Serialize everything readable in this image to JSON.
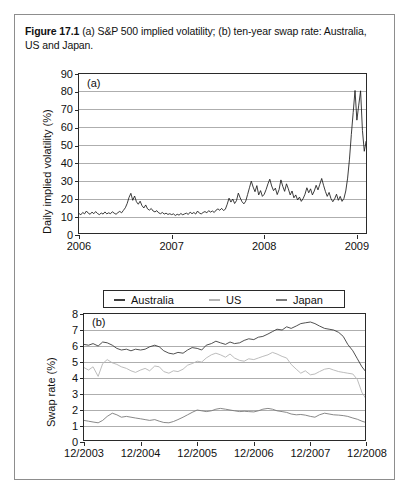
{
  "figure": {
    "caption_label": "Figure 17.1",
    "caption_text": "(a) S&P 500 implied volatility; (b) ten-year swap rate: Australia, US and Japan.",
    "border_color": "#8d8d8d"
  },
  "legend": {
    "items": [
      {
        "label": "Australia",
        "color": "#3d3d3d"
      },
      {
        "label": "US",
        "color": "#b4b4b4"
      },
      {
        "label": "Japan",
        "color": "#7a7a7a"
      }
    ]
  },
  "chart_data": [
    {
      "id": "panel-a",
      "type": "line",
      "panel_tag": "(a)",
      "title": "S&P 500 implied volatility",
      "xlabel": "",
      "ylabel": "Daily implied volatility (%)",
      "ylim": [
        0,
        90
      ],
      "yticks": [
        0,
        10,
        20,
        30,
        40,
        50,
        60,
        70,
        80,
        90
      ],
      "xlim": [
        2006.0,
        2009.12
      ],
      "xticks": [
        2006,
        2007,
        2008,
        2009
      ],
      "xticklabels": [
        "2006",
        "2007",
        "2008",
        "2009"
      ],
      "grid": true,
      "legend_position": "none",
      "line_color": "#1a1a1a",
      "series": [
        {
          "name": "S&P 500 implied volatility",
          "x": [
            2006.0,
            2006.02,
            2006.04,
            2006.06,
            2006.08,
            2006.1,
            2006.12,
            2006.14,
            2006.16,
            2006.18,
            2006.2,
            2006.22,
            2006.24,
            2006.26,
            2006.28,
            2006.3,
            2006.32,
            2006.34,
            2006.36,
            2006.38,
            2006.4,
            2006.42,
            2006.44,
            2006.46,
            2006.48,
            2006.5,
            2006.52,
            2006.54,
            2006.56,
            2006.58,
            2006.6,
            2006.62,
            2006.64,
            2006.66,
            2006.68,
            2006.7,
            2006.72,
            2006.74,
            2006.76,
            2006.78,
            2006.8,
            2006.82,
            2006.84,
            2006.86,
            2006.88,
            2006.9,
            2006.92,
            2006.94,
            2006.96,
            2006.98,
            2007.0,
            2007.02,
            2007.04,
            2007.06,
            2007.08,
            2007.1,
            2007.12,
            2007.14,
            2007.16,
            2007.18,
            2007.2,
            2007.22,
            2007.24,
            2007.26,
            2007.28,
            2007.3,
            2007.32,
            2007.34,
            2007.36,
            2007.38,
            2007.4,
            2007.42,
            2007.44,
            2007.46,
            2007.48,
            2007.5,
            2007.52,
            2007.54,
            2007.56,
            2007.58,
            2007.6,
            2007.62,
            2007.64,
            2007.66,
            2007.68,
            2007.7,
            2007.72,
            2007.74,
            2007.76,
            2007.78,
            2007.8,
            2007.82,
            2007.84,
            2007.86,
            2007.88,
            2007.9,
            2007.92,
            2007.94,
            2007.96,
            2007.98,
            2008.0,
            2008.02,
            2008.04,
            2008.06,
            2008.08,
            2008.1,
            2008.12,
            2008.14,
            2008.16,
            2008.18,
            2008.2,
            2008.22,
            2008.24,
            2008.26,
            2008.28,
            2008.3,
            2008.32,
            2008.34,
            2008.36,
            2008.38,
            2008.4,
            2008.42,
            2008.44,
            2008.46,
            2008.48,
            2008.5,
            2008.52,
            2008.54,
            2008.56,
            2008.58,
            2008.6,
            2008.62,
            2008.64,
            2008.66,
            2008.68,
            2008.7,
            2008.72,
            2008.74,
            2008.76,
            2008.78,
            2008.8,
            2008.82,
            2008.84,
            2008.86,
            2008.88,
            2008.9,
            2008.92,
            2008.94,
            2008.96,
            2008.98,
            2009.0,
            2009.02,
            2009.04,
            2009.06,
            2009.08,
            2009.1,
            2009.12
          ],
          "y": [
            12.0,
            11.3,
            12.6,
            11.8,
            13.4,
            12.2,
            11.6,
            12.8,
            11.9,
            13.1,
            12.0,
            11.4,
            12.3,
            11.7,
            12.9,
            11.8,
            12.4,
            11.9,
            13.0,
            12.2,
            11.6,
            12.5,
            13.2,
            12.4,
            13.8,
            15.2,
            17.6,
            21.0,
            23.3,
            19.4,
            21.8,
            18.6,
            17.2,
            18.9,
            16.4,
            15.1,
            16.8,
            14.6,
            13.9,
            14.8,
            13.4,
            12.9,
            13.6,
            12.4,
            11.9,
            12.6,
            11.7,
            12.2,
            11.5,
            11.9,
            11.4,
            11.8,
            10.9,
            11.6,
            11.1,
            12.0,
            11.3,
            11.8,
            12.2,
            11.5,
            12.8,
            11.9,
            12.6,
            11.7,
            13.4,
            12.2,
            11.8,
            12.6,
            13.1,
            12.4,
            13.6,
            12.8,
            13.4,
            12.6,
            13.9,
            14.6,
            13.8,
            14.9,
            13.7,
            14.4,
            17.2,
            20.6,
            18.4,
            20.1,
            17.6,
            19.2,
            23.4,
            20.8,
            18.6,
            17.4,
            18.9,
            22.6,
            26.4,
            30.1,
            26.8,
            24.2,
            27.6,
            22.4,
            24.8,
            21.6,
            22.8,
            25.4,
            28.6,
            31.2,
            27.4,
            24.8,
            26.2,
            22.6,
            25.4,
            30.8,
            27.2,
            24.4,
            28.6,
            25.8,
            22.4,
            24.6,
            20.8,
            22.4,
            19.6,
            21.2,
            18.8,
            20.4,
            22.8,
            26.4,
            23.6,
            25.8,
            22.4,
            24.6,
            27.8,
            25.2,
            28.4,
            31.6,
            27.8,
            24.4,
            21.6,
            23.8,
            20.4,
            18.6,
            20.2,
            22.8,
            19.4,
            21.6,
            18.8,
            20.4,
            24.6,
            31.8,
            42.4,
            56.2,
            68.4,
            80.8,
            64.2,
            72.6,
            80.6,
            58.4,
            46.8,
            52.4,
            44.2
          ]
        }
      ]
    },
    {
      "id": "panel-b",
      "type": "line",
      "panel_tag": "(b)",
      "title": "Ten-year swap rate: Australia, US and Japan",
      "xlabel": "",
      "ylabel": "Swap rate (%)",
      "ylim": [
        0,
        8
      ],
      "yticks": [
        0,
        1,
        2,
        3,
        4,
        5,
        6,
        7,
        8
      ],
      "xlim": [
        2003.92,
        2008.92
      ],
      "xticks": [
        2003.92,
        2004.92,
        2005.92,
        2006.92,
        2007.92,
        2008.92
      ],
      "xticklabels": [
        "12/2003",
        "12/2004",
        "12/2005",
        "12/2006",
        "12/2007",
        "12/2008"
      ],
      "grid": true,
      "legend_position": "above",
      "series": [
        {
          "name": "Australia",
          "color": "#3d3d3d",
          "x": [
            2003.92,
            2004.0,
            2004.08,
            2004.17,
            2004.25,
            2004.33,
            2004.42,
            2004.5,
            2004.58,
            2004.67,
            2004.75,
            2004.83,
            2004.92,
            2005.0,
            2005.08,
            2005.17,
            2005.25,
            2005.33,
            2005.42,
            2005.5,
            2005.58,
            2005.67,
            2005.75,
            2005.83,
            2005.92,
            2006.0,
            2006.08,
            2006.17,
            2006.25,
            2006.33,
            2006.42,
            2006.5,
            2006.58,
            2006.67,
            2006.75,
            2006.83,
            2006.92,
            2007.0,
            2007.08,
            2007.17,
            2007.25,
            2007.33,
            2007.42,
            2007.5,
            2007.58,
            2007.67,
            2007.75,
            2007.83,
            2007.92,
            2008.0,
            2008.08,
            2008.17,
            2008.25,
            2008.33,
            2008.42,
            2008.5,
            2008.58,
            2008.67,
            2008.75,
            2008.83,
            2008.92
          ],
          "y": [
            6.1,
            6.05,
            6.15,
            6.0,
            6.25,
            6.2,
            6.05,
            5.85,
            5.75,
            5.8,
            5.7,
            5.8,
            5.75,
            5.8,
            5.95,
            6.05,
            5.95,
            5.7,
            5.55,
            5.5,
            5.6,
            5.55,
            5.75,
            5.9,
            5.85,
            5.75,
            6.05,
            6.15,
            6.3,
            6.2,
            6.1,
            6.25,
            6.15,
            6.2,
            6.35,
            6.45,
            6.4,
            6.55,
            6.6,
            6.75,
            6.9,
            7.05,
            7.0,
            7.2,
            7.1,
            7.25,
            7.4,
            7.45,
            7.5,
            7.4,
            7.25,
            7.1,
            7.05,
            7.0,
            6.85,
            6.6,
            6.1,
            5.7,
            5.2,
            4.7,
            4.3
          ]
        },
        {
          "name": "US",
          "color": "#b4b4b4",
          "x": [
            2003.92,
            2004.0,
            2004.08,
            2004.17,
            2004.25,
            2004.33,
            2004.42,
            2004.5,
            2004.58,
            2004.67,
            2004.75,
            2004.83,
            2004.92,
            2005.0,
            2005.08,
            2005.17,
            2005.25,
            2005.33,
            2005.42,
            2005.5,
            2005.58,
            2005.67,
            2005.75,
            2005.83,
            2005.92,
            2006.0,
            2006.08,
            2006.17,
            2006.25,
            2006.33,
            2006.42,
            2006.5,
            2006.58,
            2006.67,
            2006.75,
            2006.83,
            2006.92,
            2007.0,
            2007.08,
            2007.17,
            2007.25,
            2007.33,
            2007.42,
            2007.5,
            2007.58,
            2007.67,
            2007.75,
            2007.83,
            2007.92,
            2008.0,
            2008.08,
            2008.17,
            2008.25,
            2008.33,
            2008.42,
            2008.5,
            2008.58,
            2008.67,
            2008.75,
            2008.83,
            2008.92
          ],
          "y": [
            4.65,
            4.5,
            4.7,
            4.1,
            4.9,
            5.15,
            4.95,
            4.85,
            4.7,
            4.6,
            4.45,
            4.35,
            4.5,
            4.6,
            4.45,
            4.75,
            4.7,
            4.4,
            4.3,
            4.45,
            4.4,
            4.55,
            4.8,
            4.9,
            5.05,
            5.0,
            5.25,
            5.45,
            5.55,
            5.45,
            5.3,
            5.5,
            5.25,
            5.1,
            5.05,
            5.2,
            5.15,
            5.25,
            5.35,
            5.45,
            5.6,
            5.5,
            5.35,
            5.25,
            4.85,
            4.55,
            4.3,
            4.45,
            4.2,
            4.25,
            4.4,
            4.55,
            4.6,
            4.5,
            4.4,
            4.35,
            4.3,
            4.25,
            3.9,
            3.1,
            2.6
          ]
        },
        {
          "name": "Japan",
          "color": "#7a7a7a",
          "x": [
            2003.92,
            2004.0,
            2004.08,
            2004.17,
            2004.25,
            2004.33,
            2004.42,
            2004.5,
            2004.58,
            2004.67,
            2004.75,
            2004.83,
            2004.92,
            2005.0,
            2005.08,
            2005.17,
            2005.25,
            2005.33,
            2005.42,
            2005.5,
            2005.58,
            2005.67,
            2005.75,
            2005.83,
            2005.92,
            2006.0,
            2006.08,
            2006.17,
            2006.25,
            2006.33,
            2006.42,
            2006.5,
            2006.58,
            2006.67,
            2006.75,
            2006.83,
            2006.92,
            2007.0,
            2007.08,
            2007.17,
            2007.25,
            2007.33,
            2007.42,
            2007.5,
            2007.58,
            2007.67,
            2007.75,
            2007.83,
            2007.92,
            2008.0,
            2008.08,
            2008.17,
            2008.25,
            2008.33,
            2008.42,
            2008.5,
            2008.58,
            2008.67,
            2008.75,
            2008.83,
            2008.92
          ],
          "y": [
            1.35,
            1.3,
            1.25,
            1.2,
            1.35,
            1.6,
            1.8,
            1.7,
            1.55,
            1.6,
            1.55,
            1.5,
            1.45,
            1.4,
            1.35,
            1.4,
            1.3,
            1.22,
            1.2,
            1.28,
            1.4,
            1.55,
            1.7,
            1.85,
            2.0,
            1.95,
            1.9,
            1.95,
            2.05,
            2.1,
            2.05,
            2.0,
            1.95,
            1.9,
            1.92,
            1.9,
            1.88,
            1.95,
            2.05,
            2.1,
            2.05,
            1.95,
            1.9,
            1.85,
            1.75,
            1.7,
            1.72,
            1.68,
            1.6,
            1.55,
            1.7,
            1.8,
            1.75,
            1.7,
            1.68,
            1.65,
            1.6,
            1.5,
            1.42,
            1.3,
            1.2
          ]
        }
      ]
    }
  ]
}
